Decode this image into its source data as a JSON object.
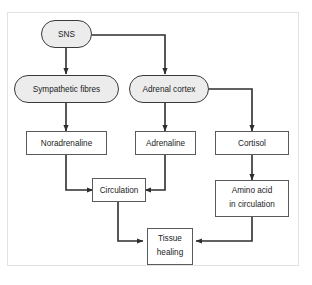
{
  "figure": {
    "type": "flowchart",
    "orientation": "top-to-bottom",
    "title_text": "",
    "frame": {
      "visible": true,
      "color": "#e3e3e3"
    },
    "styles": {
      "stadium_fill": "#ececec",
      "stadium_stroke": "#3a3a3a",
      "rect_fill": "#ffffff",
      "rect_stroke": "#5a5a5a",
      "edge_color": "#2e2e2e",
      "text_color": "#1b1b1b"
    },
    "nodes": [
      {
        "id": "sns",
        "label": "SNS",
        "shape": "stadium",
        "lines": [
          "SNS"
        ]
      },
      {
        "id": "symp",
        "label": "Sympathetic fibres",
        "shape": "stadium",
        "lines": [
          "Sympathetic fibres"
        ]
      },
      {
        "id": "adrenal",
        "label": "Adrenal cortex",
        "shape": "stadium",
        "lines": [
          "Adrenal cortex"
        ]
      },
      {
        "id": "noradrenaline",
        "label": "Noradrenaline",
        "shape": "rectangle",
        "lines": [
          "Noradrenaline"
        ]
      },
      {
        "id": "adrenaline",
        "label": "Adrenaline",
        "shape": "rectangle",
        "lines": [
          "Adrenaline"
        ]
      },
      {
        "id": "cortisol",
        "label": "Cortisol",
        "shape": "rectangle",
        "lines": [
          "Cortisol"
        ]
      },
      {
        "id": "circulation",
        "label": "Circulation",
        "shape": "rectangle",
        "lines": [
          "Circulation"
        ]
      },
      {
        "id": "aminoacid",
        "label": "Amino acid in circulation",
        "shape": "rectangle",
        "lines": [
          "Amino acid",
          "in circulation"
        ]
      },
      {
        "id": "tissue",
        "label": "Tissue healing",
        "shape": "rectangle",
        "lines": [
          "Tissue",
          "healing"
        ]
      }
    ],
    "edges": [
      {
        "from": "sns",
        "to": "symp",
        "style": "elbow-down"
      },
      {
        "from": "sns",
        "to": "adrenal",
        "style": "elbow-right-down"
      },
      {
        "from": "symp",
        "to": "noradrenaline",
        "style": "straight-down"
      },
      {
        "from": "adrenal",
        "to": "adrenaline",
        "style": "straight-down"
      },
      {
        "from": "adrenal",
        "to": "cortisol",
        "style": "elbow-right-down"
      },
      {
        "from": "noradrenaline",
        "to": "circulation",
        "style": "elbow-down-right"
      },
      {
        "from": "adrenaline",
        "to": "circulation",
        "style": "elbow-down-left"
      },
      {
        "from": "cortisol",
        "to": "aminoacid",
        "style": "straight-down"
      },
      {
        "from": "circulation",
        "to": "tissue",
        "style": "elbow-down-right"
      },
      {
        "from": "aminoacid",
        "to": "tissue",
        "style": "elbow-down-left"
      }
    ]
  }
}
